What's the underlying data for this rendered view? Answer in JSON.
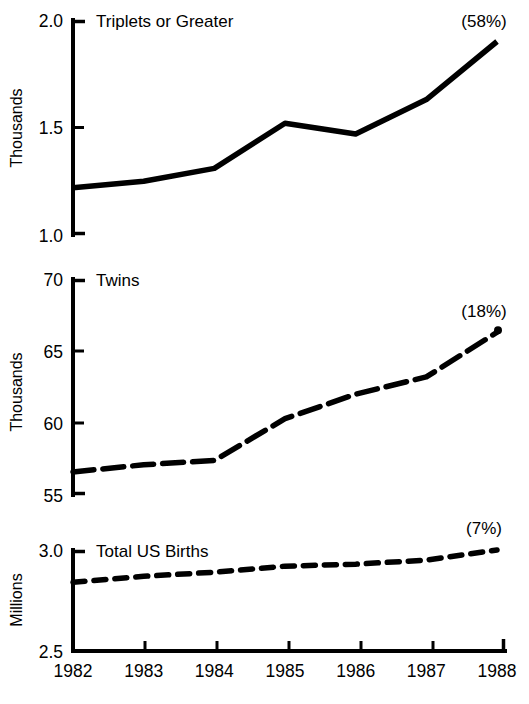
{
  "chart_data": {
    "type": "line",
    "title": "",
    "subtitle": "",
    "xlabel": "",
    "x": [
      1982,
      1983,
      1984,
      1985,
      1986,
      1987,
      1988
    ],
    "x_tick_labels": [
      "1982",
      "1983",
      "1984",
      "1985",
      "1986",
      "1987",
      "1988"
    ],
    "grid": false,
    "legend_position": "none",
    "panels": [
      {
        "panel_title": "Triplets or Greater",
        "ylabel": "Thousands",
        "ylim": [
          1.0,
          2.0
        ],
        "y_ticks": [
          1.0,
          1.5,
          2.0
        ],
        "y_tick_labels": [
          "1.0",
          "1.5",
          "2.0"
        ],
        "line_style": "solid",
        "annotation": "(58%)",
        "values": [
          1.22,
          1.25,
          1.31,
          1.52,
          1.47,
          1.63,
          1.9
        ],
        "end_marker": false
      },
      {
        "panel_title": "Twins",
        "ylabel": "Thousands",
        "ylim": [
          55,
          70
        ],
        "y_ticks": [
          55,
          60,
          65,
          70
        ],
        "y_tick_labels": [
          "55",
          "60",
          "65",
          "70"
        ],
        "line_style": "dashed-long",
        "annotation": "(18%)",
        "values": [
          56.6,
          57.1,
          57.4,
          60.3,
          62.0,
          63.2,
          66.3
        ],
        "end_marker": true
      },
      {
        "panel_title": "Total US Births",
        "ylabel": "Millions",
        "ylim": [
          2.5,
          3.0
        ],
        "y_ticks": [
          2.5,
          3.0
        ],
        "y_tick_labels": [
          "2.5",
          "3.0"
        ],
        "line_style": "dashed-short",
        "annotation": "(7%)",
        "values": [
          2.84,
          2.87,
          2.89,
          2.92,
          2.93,
          2.95,
          3.0
        ],
        "end_marker": false
      }
    ],
    "colors": {
      "line": "#000000",
      "axis": "#000000",
      "text": "#000000",
      "background": "#ffffff"
    }
  }
}
